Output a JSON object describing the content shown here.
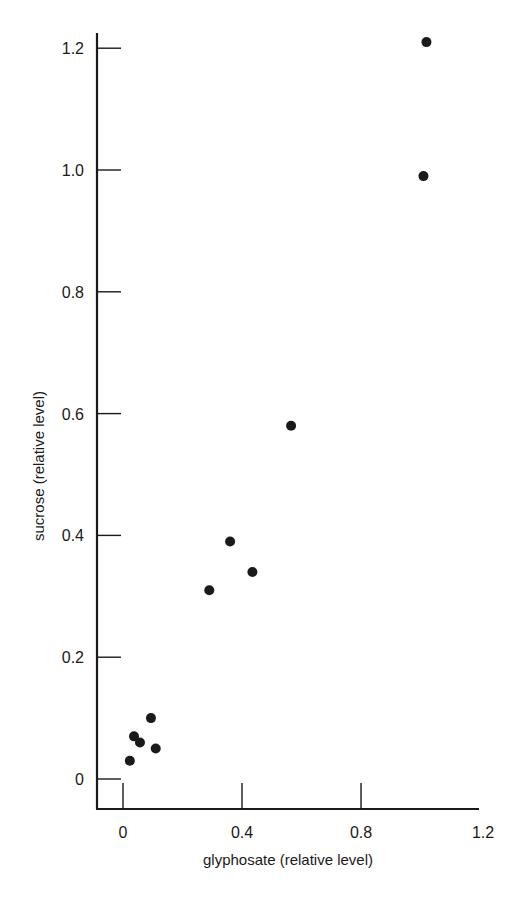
{
  "chart_data": {
    "type": "scatter",
    "title": "",
    "xlabel": "glyphosate (relative level)",
    "ylabel": "sucrose (relative level)",
    "xlim": [
      -0.09,
      1.19
    ],
    "ylim": [
      -0.05,
      1.24
    ],
    "grid": false,
    "legend": null,
    "x_ticks": [
      0,
      0.4,
      0.8,
      1.2
    ],
    "x_tick_labels": [
      "0",
      "0.4",
      "0.8",
      "1.2"
    ],
    "y_ticks": [
      0,
      0.2,
      0.4,
      0.6,
      0.8,
      1.0,
      1.2
    ],
    "y_tick_labels": [
      "0",
      "0.2",
      "0.4",
      "0.6",
      "0.8",
      "1.0",
      "1.2"
    ],
    "marker": "filled-circle",
    "marker_color": "#1a1a1a",
    "series": [
      {
        "name": "samples",
        "points": [
          {
            "x": 1.02,
            "y": 1.21
          },
          {
            "x": 1.01,
            "y": 0.99
          },
          {
            "x": 0.565,
            "y": 0.58
          },
          {
            "x": 0.36,
            "y": 0.39
          },
          {
            "x": 0.435,
            "y": 0.34
          },
          {
            "x": 0.29,
            "y": 0.31
          },
          {
            "x": 0.094,
            "y": 0.1
          },
          {
            "x": 0.037,
            "y": 0.07
          },
          {
            "x": 0.057,
            "y": 0.06
          },
          {
            "x": 0.11,
            "y": 0.05
          },
          {
            "x": 0.023,
            "y": 0.03
          }
        ]
      }
    ]
  }
}
